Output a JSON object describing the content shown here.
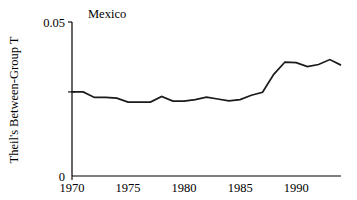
{
  "chart_data": {
    "type": "line",
    "title": "Mexico",
    "xlabel": "",
    "ylabel": "Theil's Between-Group T",
    "xlim": [
      1970,
      1994
    ],
    "ylim": [
      0,
      0.05
    ],
    "grid": false,
    "legend": null,
    "y_ticks": [
      {
        "value": 0.05,
        "label": "0.05"
      },
      {
        "value": 0,
        "label": "0"
      }
    ],
    "y_minor_ticks": [
      0.0273
    ],
    "x_ticks": [
      {
        "value": 1970,
        "label": "1970"
      },
      {
        "value": 1975,
        "label": "1975"
      },
      {
        "value": 1980,
        "label": "1980"
      },
      {
        "value": 1985,
        "label": "1985"
      },
      {
        "value": 1990,
        "label": "1990"
      }
    ],
    "series": [
      {
        "name": "Theil's Between-Group T",
        "color": "#1a1a1a",
        "x": [
          1970,
          1971,
          1972,
          1973,
          1974,
          1975,
          1976,
          1977,
          1978,
          1979,
          1980,
          1981,
          1982,
          1983,
          1984,
          1985,
          1986,
          1987,
          1988,
          1989,
          1990,
          1991,
          1992,
          1993,
          1994
        ],
        "values": [
          0.0273,
          0.0273,
          0.0255,
          0.0255,
          0.0253,
          0.024,
          0.024,
          0.024,
          0.0258,
          0.0243,
          0.0243,
          0.0248,
          0.0256,
          0.025,
          0.0244,
          0.0248,
          0.0262,
          0.0272,
          0.033,
          0.037,
          0.0368,
          0.0355,
          0.0362,
          0.0378,
          0.036
        ]
      }
    ]
  }
}
